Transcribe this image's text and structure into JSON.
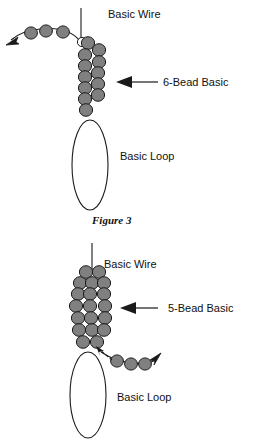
{
  "page": {
    "background_color": "#ffffff"
  },
  "style": {
    "bead_fill": "#808080",
    "bead_stroke": "#1a1a1a",
    "wire_stroke": "#1a1a1a",
    "text_color": "#111111"
  },
  "figures": [
    {
      "id": "figure-top",
      "name": "six-bead-basic-diagram",
      "labels": {
        "wire": "Basic Wire",
        "bead_group": "6-Bead Basic",
        "loop": "Basic Loop"
      },
      "tail_bead_count": 3,
      "tail_arrow_direction": "left",
      "bead_columns": 2,
      "bead_group_size": 6
    },
    {
      "id": "figure-bottom",
      "name": "five-bead-basic-diagram",
      "labels": {
        "wire": "Basic Wire",
        "bead_group": "5-Bead Basic",
        "loop": "Basic Loop"
      },
      "tail_bead_count": 3,
      "tail_arrow_direction": "right",
      "bead_columns": 3,
      "bead_group_size": 5
    }
  ],
  "caption": {
    "text": "Figure 3"
  }
}
